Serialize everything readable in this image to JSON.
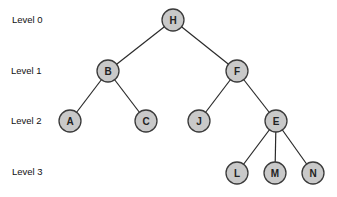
{
  "levels": [
    {
      "label": "Level 0",
      "x": 12,
      "y": 20
    },
    {
      "label": "Level 1",
      "x": 11,
      "y": 71
    },
    {
      "label": "Level 2",
      "x": 11,
      "y": 121
    },
    {
      "label": "Level 3",
      "x": 12,
      "y": 172
    }
  ],
  "nodes": [
    {
      "id": "H",
      "x": 173,
      "y": 20
    },
    {
      "id": "B",
      "x": 108,
      "y": 71
    },
    {
      "id": "F",
      "x": 237,
      "y": 71
    },
    {
      "id": "A",
      "x": 70,
      "y": 121
    },
    {
      "id": "C",
      "x": 146,
      "y": 121
    },
    {
      "id": "J",
      "x": 199,
      "y": 121
    },
    {
      "id": "E",
      "x": 276,
      "y": 121
    },
    {
      "id": "L",
      "x": 237,
      "y": 173
    },
    {
      "id": "M",
      "x": 275,
      "y": 173
    },
    {
      "id": "N",
      "x": 313,
      "y": 173
    }
  ],
  "edges": [
    [
      "H",
      "B"
    ],
    [
      "H",
      "F"
    ],
    [
      "B",
      "A"
    ],
    [
      "B",
      "C"
    ],
    [
      "F",
      "J"
    ],
    [
      "F",
      "E"
    ],
    [
      "E",
      "L"
    ],
    [
      "E",
      "M"
    ],
    [
      "E",
      "N"
    ]
  ],
  "style": {
    "node_fill": "#c9c9c9",
    "node_stroke": "#3a3a3a",
    "edge_color": "#2a2a2a",
    "node_radius": 11
  }
}
